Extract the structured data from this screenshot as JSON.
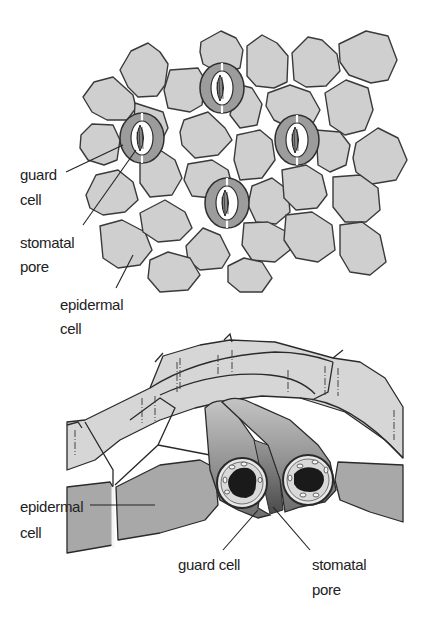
{
  "figure": {
    "surface_view": {
      "labels": {
        "guard_cell_line1": "guard",
        "guard_cell_line2": "cell",
        "stomatal_pore_line1": "stomatal",
        "stomatal_pore_line2": "pore",
        "epidermal_cell_line1": "epidermal",
        "epidermal_cell_line2": "cell"
      },
      "stomata_count": 4
    },
    "cross_section": {
      "labels": {
        "epidermal_cell_line1": "epidermal",
        "epidermal_cell_line2": "cell",
        "guard_cell": "guard cell",
        "stomatal_pore_line1": "stomatal",
        "stomatal_pore_line2": "pore"
      }
    },
    "colors": {
      "epidermal_cell_fill": "#cfcfcf",
      "guard_cell_fill": "#9a9a9a",
      "cell_outline": "#3a3a3a",
      "nucleus": "#1a1a1a",
      "background": "#ffffff"
    }
  }
}
